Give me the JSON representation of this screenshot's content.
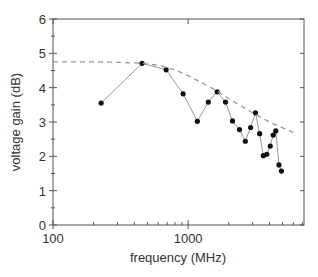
{
  "chart_data": {
    "type": "line",
    "title": "",
    "xlabel": "frequency (MHz)",
    "ylabel": "voltage gain (dB)",
    "xscale": "log",
    "xlim": [
      100,
      7200
    ],
    "ylim": [
      0,
      6
    ],
    "grid": false,
    "legend": null,
    "x_ticks": [
      100,
      1000
    ],
    "x_tick_labels": [
      "100",
      "1000"
    ],
    "x_minor_ticks": [
      200,
      300,
      400,
      500,
      600,
      700,
      800,
      900,
      2000,
      3000,
      4000,
      5000,
      6000,
      7000
    ],
    "y_ticks": [
      0,
      1,
      2,
      3,
      4,
      5,
      6
    ],
    "y_tick_labels": [
      "0",
      "1",
      "2",
      "3",
      "4",
      "5",
      "6"
    ],
    "y_minor_ticks": [
      0.5,
      1.5,
      2.5,
      3.5,
      4.5,
      5.5
    ],
    "series": [
      {
        "name": "measured",
        "style": "solid-markers",
        "color": "#999999",
        "marker_color": "#111111",
        "x": [
          227,
          456,
          687,
          918,
          1170,
          1410,
          1640,
          1890,
          2130,
          2400,
          2650,
          2900,
          3150,
          3380,
          3600,
          3820,
          4050,
          4260,
          4450,
          4700,
          4900
        ],
        "y": [
          3.55,
          4.71,
          4.52,
          3.82,
          3.02,
          3.58,
          3.88,
          3.58,
          3.03,
          2.78,
          2.44,
          2.84,
          3.27,
          2.66,
          2.02,
          2.06,
          2.3,
          2.62,
          2.74,
          1.75,
          1.57
        ]
      },
      {
        "name": "envelope",
        "style": "dashed",
        "color": "#999999",
        "x": [
          100,
          200,
          300,
          456,
          600,
          800,
          1000,
          1300,
          1640,
          2000,
          2500,
          3150,
          4000,
          5000,
          6000
        ],
        "y": [
          4.75,
          4.75,
          4.74,
          4.71,
          4.65,
          4.52,
          4.35,
          4.12,
          3.9,
          3.68,
          3.45,
          3.22,
          3.0,
          2.83,
          2.7
        ]
      }
    ]
  }
}
